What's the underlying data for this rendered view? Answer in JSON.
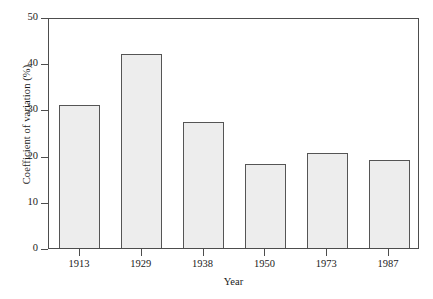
{
  "chart_data": {
    "type": "bar",
    "title": "",
    "xlabel": "Year",
    "ylabel": "Coefficient of variation (%)",
    "categories": [
      "1913",
      "1929",
      "1938",
      "1950",
      "1973",
      "1987"
    ],
    "values": [
      31.0,
      42.0,
      27.2,
      18.2,
      20.6,
      19.0
    ],
    "ylim": [
      0,
      50
    ],
    "yticks": [
      0,
      10,
      20,
      30,
      40,
      50
    ],
    "ytick_labels": [
      "0",
      "10",
      "20",
      "30",
      "40",
      "50"
    ],
    "grid": false,
    "legend": null,
    "series": [
      {
        "name": "Coefficient of variation",
        "values": [
          31.0,
          42.0,
          27.2,
          18.2,
          20.6,
          19.0
        ]
      }
    ],
    "style": {
      "bar_fill": "#ededed",
      "bar_edge": "#555555",
      "axis_color": "#4d4d4d",
      "background": "#ffffff"
    }
  }
}
